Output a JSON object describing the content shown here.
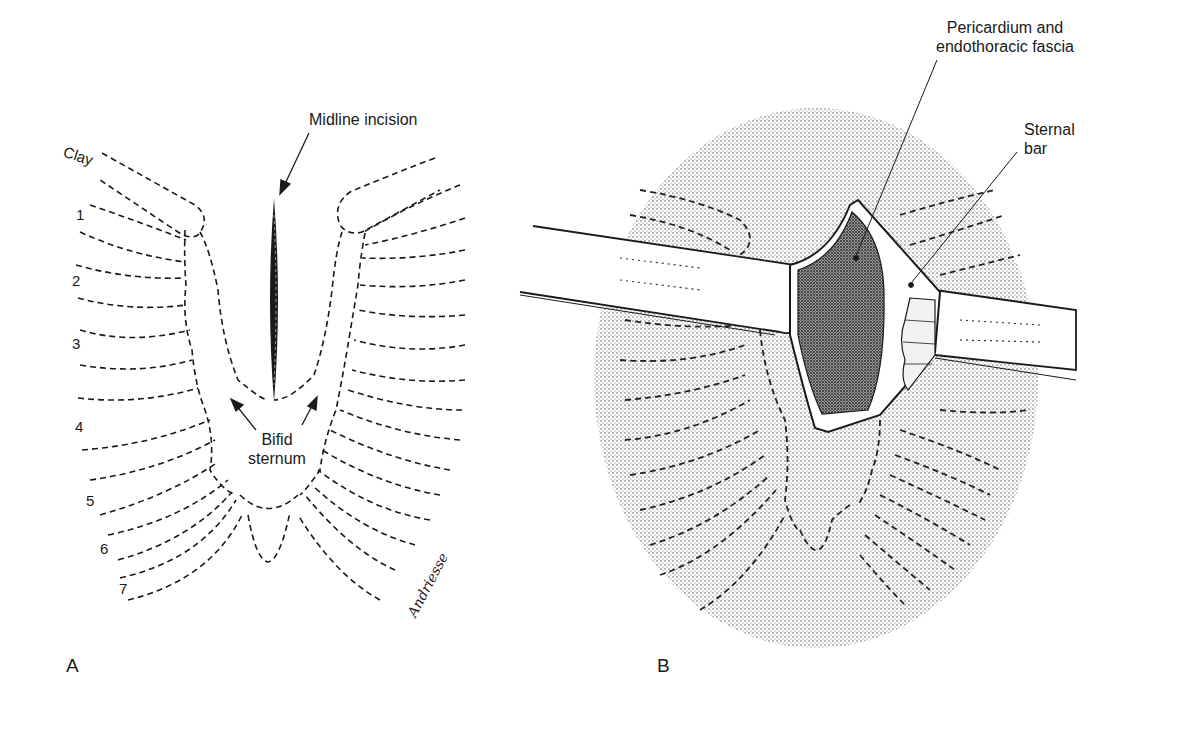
{
  "figure": {
    "panel_a": {
      "letter": "A",
      "labels": {
        "midline_incision": "Midline incision",
        "clavicle": "Clay",
        "bifid_sternum_line1": "Bifid",
        "bifid_sternum_line2": "sternum",
        "signature": "Andriesse"
      },
      "rib_numbers": [
        "1",
        "2",
        "3",
        "4",
        "5",
        "6",
        "7"
      ]
    },
    "panel_b": {
      "letter": "B",
      "labels": {
        "pericardium_line1": "Pericardium and",
        "pericardium_line2": "endothoracic fascia",
        "sternal_bar_line1": "Sternal",
        "sternal_bar_line2": "bar"
      }
    },
    "colors": {
      "ink": "#1a1a1a",
      "stipple": "#c8c8c8",
      "background": "#ffffff"
    }
  }
}
